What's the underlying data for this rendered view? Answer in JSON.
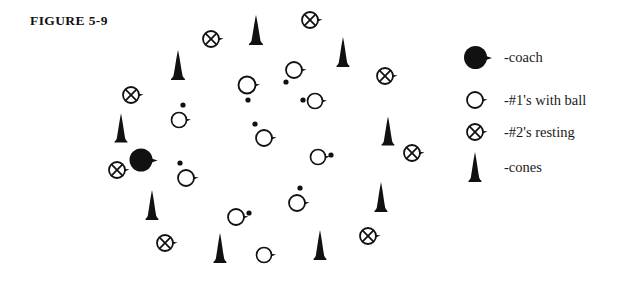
{
  "figure": {
    "title": "FIGURE 5-9"
  },
  "colors": {
    "ink": "#111111",
    "paper": "#ffffff",
    "stroke": "#1a1a1a"
  },
  "legend": {
    "items": [
      {
        "icon": "filled-circle-coach-icon",
        "label": "-coach",
        "symbol": "coach"
      },
      {
        "icon": "open-circle-player-icon",
        "label": "-#1's with ball",
        "symbol": "player1"
      },
      {
        "icon": "crossed-circle-icon",
        "label": "-#2's resting",
        "symbol": "player2"
      },
      {
        "icon": "cone-icon",
        "label": "-cones",
        "symbol": "cone"
      }
    ]
  },
  "field": {
    "description": "Circular practice formation of players, resting players and cones around a coach",
    "markers": [
      {
        "type": "coach",
        "x": 141,
        "y": 160,
        "r": 11.5
      },
      {
        "type": "player1",
        "x": 179,
        "y": 120,
        "r": 7.5,
        "ball": {
          "x": 183,
          "y": 105
        }
      },
      {
        "type": "player1",
        "x": 247,
        "y": 85,
        "r": 8.5,
        "ball": {
          "x": 248,
          "y": 100
        }
      },
      {
        "type": "player1",
        "x": 294,
        "y": 70,
        "r": 8.0,
        "ball": {
          "x": 286,
          "y": 82
        }
      },
      {
        "type": "player1",
        "x": 315,
        "y": 101,
        "r": 7.5,
        "ball": {
          "x": 303,
          "y": 100
        }
      },
      {
        "type": "player1",
        "x": 264,
        "y": 138,
        "r": 8.0,
        "ball": {
          "x": 255,
          "y": 124
        }
      },
      {
        "type": "player1",
        "x": 318,
        "y": 157,
        "r": 7.5,
        "ball": {
          "x": 331,
          "y": 155
        }
      },
      {
        "type": "player1",
        "x": 186,
        "y": 178,
        "r": 8.0,
        "ball": {
          "x": 180,
          "y": 163
        }
      },
      {
        "type": "player1",
        "x": 236,
        "y": 217,
        "r": 8.0,
        "ball": {
          "x": 249,
          "y": 213
        }
      },
      {
        "type": "player1",
        "x": 297,
        "y": 203,
        "r": 8.0,
        "ball": {
          "x": 300,
          "y": 188
        }
      },
      {
        "type": "player1",
        "x": 264,
        "y": 255,
        "r": 7.5,
        "ball": null
      },
      {
        "type": "player2",
        "x": 211,
        "y": 39,
        "r": 8.0
      },
      {
        "type": "player2",
        "x": 310,
        "y": 20,
        "r": 8.0
      },
      {
        "type": "player2",
        "x": 385,
        "y": 76,
        "r": 8.0
      },
      {
        "type": "player2",
        "x": 412,
        "y": 153,
        "r": 8.0
      },
      {
        "type": "player2",
        "x": 368,
        "y": 236,
        "r": 8.0
      },
      {
        "type": "player2",
        "x": 131,
        "y": 95,
        "r": 8.0
      },
      {
        "type": "player2",
        "x": 117,
        "y": 170,
        "r": 8.0
      },
      {
        "type": "player2",
        "x": 165,
        "y": 243,
        "r": 8.0
      },
      {
        "type": "cone",
        "x": 256,
        "y": 30,
        "w": 15,
        "h": 30
      },
      {
        "type": "cone",
        "x": 178,
        "y": 65,
        "w": 15,
        "h": 30
      },
      {
        "type": "cone",
        "x": 343,
        "y": 52,
        "w": 14,
        "h": 30
      },
      {
        "type": "cone",
        "x": 121,
        "y": 128,
        "w": 14,
        "h": 29
      },
      {
        "type": "cone",
        "x": 388,
        "y": 131,
        "w": 14,
        "h": 29
      },
      {
        "type": "cone",
        "x": 152,
        "y": 205,
        "w": 14,
        "h": 30
      },
      {
        "type": "cone",
        "x": 381,
        "y": 197,
        "w": 14,
        "h": 30
      },
      {
        "type": "cone",
        "x": 220,
        "y": 248,
        "w": 14,
        "h": 30
      },
      {
        "type": "cone",
        "x": 320,
        "y": 245,
        "w": 14,
        "h": 30
      }
    ]
  }
}
